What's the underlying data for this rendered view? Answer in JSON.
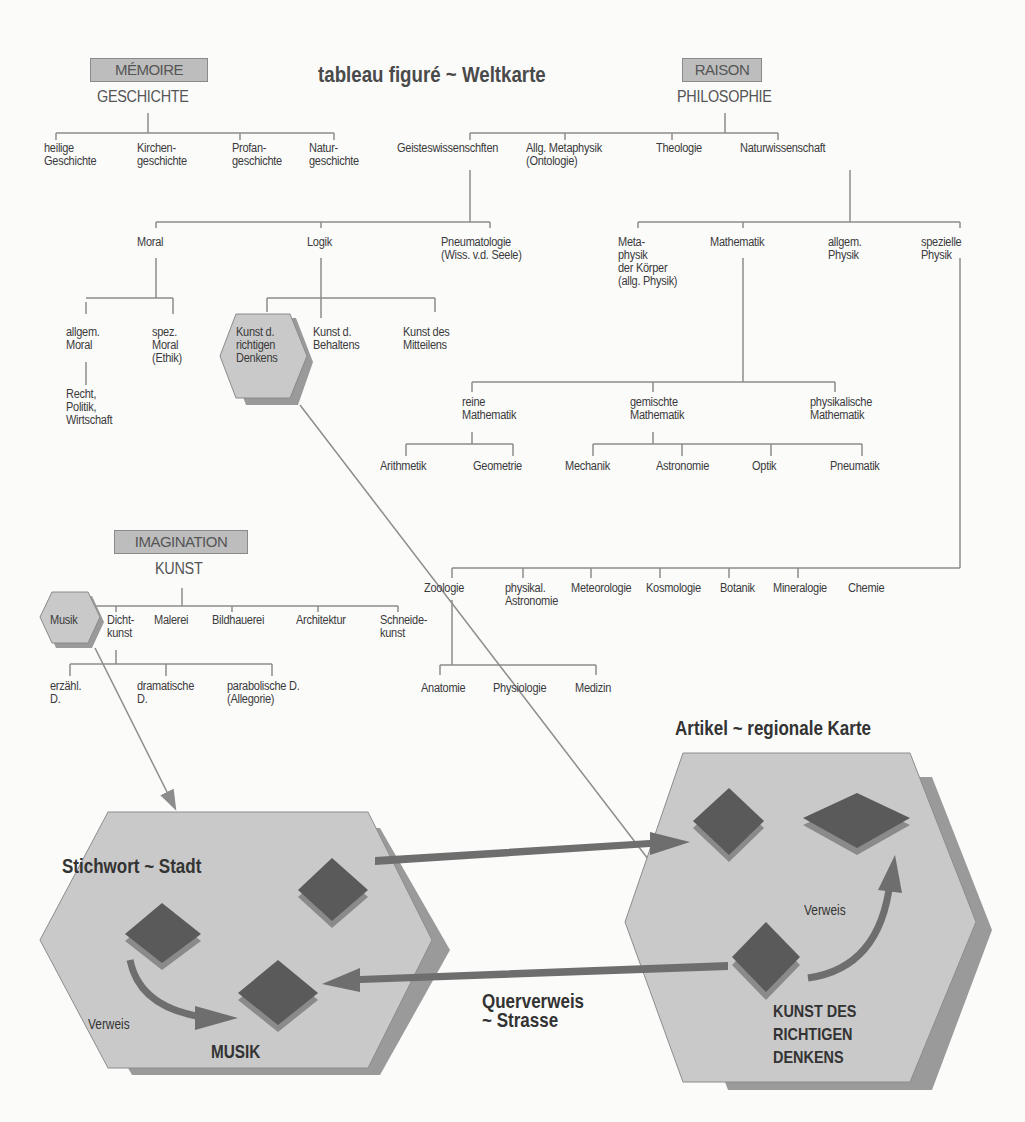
{
  "title": "tableau figuré ~ Weltkarte",
  "faculties": {
    "memoire": {
      "label": "MÉMOIRE",
      "domain": "GESCHICHTE"
    },
    "raison": {
      "label": "RAISON",
      "domain": "PHILOSOPHIE"
    },
    "imagination": {
      "label": "IMAGINATION",
      "domain": "KUNST"
    }
  },
  "geschichte": [
    "heilige\nGeschichte",
    "Kirchen-\ngeschichte",
    "Profan-\ngeschichte",
    "Natur-\ngeschichte"
  ],
  "philosophie": [
    "Geisteswissenschften",
    "Allg. Metaphysik\n(Ontologie)",
    "Theologie",
    "Naturwissenschaft"
  ],
  "geisteswissenschaften": [
    "Moral",
    "Logik",
    "Pneumatologie\n(Wiss. v.d. Seele)"
  ],
  "moral": [
    "allgem.\nMoral",
    "spez.\nMoral\n(Ethik)"
  ],
  "moral_sub": "Recht,\nPolitik,\nWirtschaft",
  "logik": [
    "Kunst d.\nrichtigen\nDenkens",
    "Kunst d.\nBehaltens",
    "Kunst des\nMitteilens"
  ],
  "naturwissenschaft": [
    "Meta-\nphysik\nder Körper\n(allg. Physik)",
    "Mathematik",
    "allgem.\nPhysik",
    "spezielle\nPhysik"
  ],
  "mathematik": [
    "reine\nMathematik",
    "gemischte\nMathematik",
    "physikalische\nMathematik"
  ],
  "reine_mathematik": [
    "Arithmetik",
    "Geometrie"
  ],
  "gemischte_mathematik": [
    "Mechanik",
    "Astronomie",
    "Optik",
    "Pneumatik"
  ],
  "spezielle_physik": [
    "Zoologie",
    "physikal.\nAstronomie",
    "Meteorologie",
    "Kosmologie",
    "Botanik",
    "Mineralogie",
    "Chemie"
  ],
  "zoologie": [
    "Anatomie",
    "Physiologie",
    "Medizin"
  ],
  "kunst": [
    "Musik",
    "Dicht-\nkunst",
    "Malerei",
    "Bildhauerei",
    "Architektur",
    "Schneide-\nkunst"
  ],
  "dichtkunst": [
    "erzähl.\nD.",
    "dramatische\nD.",
    "parabolische D.\n(Allegorie)"
  ],
  "bottom": {
    "left_hex": {
      "heading": "Stichwort ~ Stadt",
      "verweis": "Verweis",
      "name": "MUSIK"
    },
    "right_hex": {
      "heading": "Artikel ~ regionale Karte",
      "verweis": "Verweis",
      "name": "KUNST DES\nRICHTIGEN\nDENKENS"
    },
    "cross_ref": "Querverweis\n~ Strasse"
  },
  "colors": {
    "hex_fill": "#c9c9c9",
    "hex_shadow": "#9a9a9a",
    "diamond": "#5a5a5a",
    "diamond_base": "#8a8a8a",
    "line": "#8c8c8c",
    "arrow": "#6e6e6e"
  }
}
